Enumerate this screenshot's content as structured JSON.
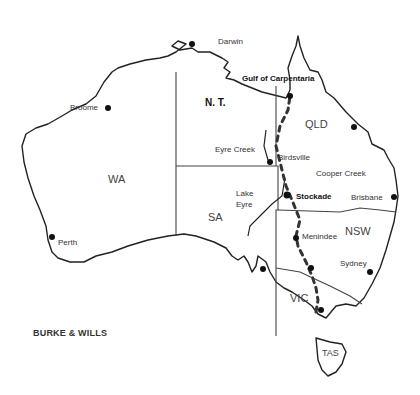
{
  "map": {
    "title": "BURKE & WILLS",
    "states": [
      {
        "id": "wa",
        "label": "WA"
      },
      {
        "id": "nt",
        "label": "N. T."
      },
      {
        "id": "qld",
        "label": "QLD"
      },
      {
        "id": "sa",
        "label": "SA"
      },
      {
        "id": "nsw",
        "label": "NSW"
      },
      {
        "id": "vic",
        "label": "VIC"
      },
      {
        "id": "tas",
        "label": "TAS"
      }
    ],
    "places": [
      {
        "id": "darwin",
        "label": "Darwin"
      },
      {
        "id": "broome",
        "label": "Broome"
      },
      {
        "id": "perth",
        "label": "Perth"
      },
      {
        "id": "gulf",
        "label": "Gulf of Carpentaria"
      },
      {
        "id": "eyre-creek",
        "label": "Eyre Creek"
      },
      {
        "id": "birdsville",
        "label": "Birdsville"
      },
      {
        "id": "cooper-creek",
        "label": "Cooper Creek"
      },
      {
        "id": "lake-eyre-1",
        "label": "Lake"
      },
      {
        "id": "lake-eyre-2",
        "label": "Eyre"
      },
      {
        "id": "stockade",
        "label": "Stockade"
      },
      {
        "id": "brisbane",
        "label": "Brisbane"
      },
      {
        "id": "menindee",
        "label": "Menindee"
      },
      {
        "id": "sydney",
        "label": "Sydney"
      }
    ],
    "route": "Burke and Wills expedition route (Melbourne to Gulf of Carpentaria)"
  }
}
